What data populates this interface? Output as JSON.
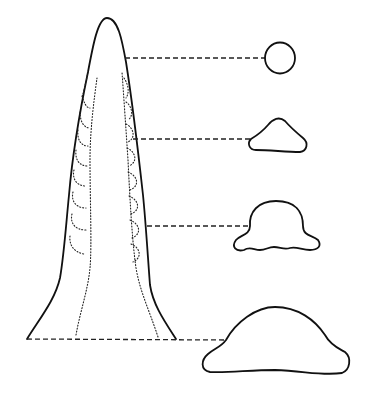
{
  "diagram": {
    "type": "line-drawing",
    "colors": {
      "background": "#ffffff",
      "stroke": "#111111"
    },
    "body": {
      "name": "cone-outline",
      "tip": [
        107,
        18
      ],
      "base_left": [
        27,
        339
      ],
      "base_right": [
        176,
        339
      ],
      "inner_structure": "dotted paired inner walls with repeating hooked chambers"
    },
    "sections": [
      {
        "id": "section-1",
        "level_y": 58,
        "shape": "circle",
        "bbox": [
          265,
          43,
          295,
          73
        ]
      },
      {
        "id": "section-2",
        "level_y": 139,
        "shape": "rounded triangle",
        "bbox": [
          249,
          118,
          306,
          153
        ]
      },
      {
        "id": "section-3",
        "level_y": 226,
        "shape": "bell with lateral lobes",
        "bbox": [
          234,
          200,
          318,
          251
        ]
      },
      {
        "id": "section-4",
        "level_y": 340,
        "shape": "broad dome",
        "bbox": [
          202,
          307,
          350,
          375
        ]
      }
    ],
    "leaders": [
      {
        "from": [
          125,
          58
        ],
        "to": [
          265,
          58
        ]
      },
      {
        "from": [
          133,
          139
        ],
        "to": [
          251,
          139
        ]
      },
      {
        "from": [
          147,
          226
        ],
        "to": [
          250,
          226
        ]
      },
      {
        "from": [
          27,
          339
        ],
        "to": [
          226,
          340
        ]
      }
    ]
  }
}
